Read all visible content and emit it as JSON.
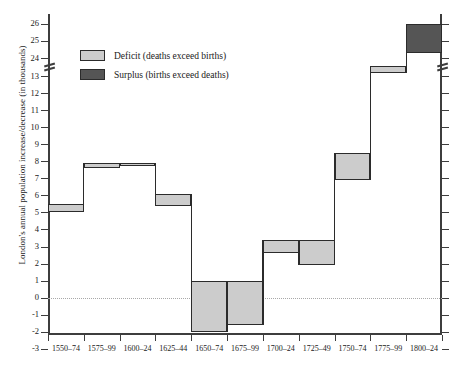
{
  "chart_data": {
    "type": "bar",
    "title": "",
    "xlabel": "",
    "ylabel": "London's annual population increase/decrease (in thousands)",
    "categories": [
      "1550–74",
      "1575–99",
      "1600–24",
      "1625–44",
      "1650–74",
      "1675–99",
      "1700–24",
      "1725–49",
      "1750–74",
      "1775–99",
      "1800–24"
    ],
    "series": [
      {
        "name": "Deficit (deaths exceed births)",
        "bands": [
          {
            "category": "1550–74",
            "low": 5.0,
            "high": 5.5,
            "kind": "deficit"
          },
          {
            "category": "1575–99",
            "low": 7.6,
            "high": 7.9,
            "kind": "deficit"
          },
          {
            "category": "1600–24",
            "low": 7.7,
            "high": 7.9,
            "kind": "deficit"
          },
          {
            "category": "1625–44",
            "low": 5.4,
            "high": 6.1,
            "kind": "deficit"
          },
          {
            "category": "1650–74",
            "low": -2.0,
            "high": 1.0,
            "kind": "deficit"
          },
          {
            "category": "1675–99",
            "low": -1.6,
            "high": 1.0,
            "kind": "deficit"
          },
          {
            "category": "1700–24",
            "low": 2.6,
            "high": 3.4,
            "kind": "deficit"
          },
          {
            "category": "1725–49",
            "low": 1.9,
            "high": 3.4,
            "kind": "deficit"
          },
          {
            "category": "1750–74",
            "low": 6.9,
            "high": 8.5,
            "kind": "deficit"
          },
          {
            "category": "1775–99",
            "low": 13.2,
            "high": 13.6,
            "kind": "deficit"
          }
        ]
      },
      {
        "name": "Surplus (births exceed deaths)",
        "bands": [
          {
            "category": "1800–24",
            "low": 24.3,
            "high": 26.0,
            "kind": "surplus"
          }
        ]
      }
    ],
    "y_ticks_upper": [
      26,
      25,
      24
    ],
    "y_ticks_lower": [
      13,
      12,
      11,
      10,
      9,
      8,
      7,
      6,
      5,
      4,
      3,
      2,
      1,
      0,
      -1,
      -2,
      -3
    ],
    "y_axis_break": true,
    "y_axis_break_between": [
      24,
      13
    ],
    "ylim_lower": [
      -3,
      13
    ],
    "ylim_upper": [
      24,
      26
    ],
    "zero_line": 0,
    "grid": false,
    "legend_position": "upper-left-inside",
    "legend": [
      {
        "label": "Deficit (deaths exceed births)",
        "color": "#cccccc"
      },
      {
        "label": "Surplus (births exceed deaths)",
        "color": "#555555"
      }
    ],
    "colors": {
      "deficit": "#cccccc",
      "surplus": "#555555",
      "axis": "#3d3d3d",
      "outline": "#2b2b2b",
      "zero_line": "#a8a8a8"
    }
  }
}
